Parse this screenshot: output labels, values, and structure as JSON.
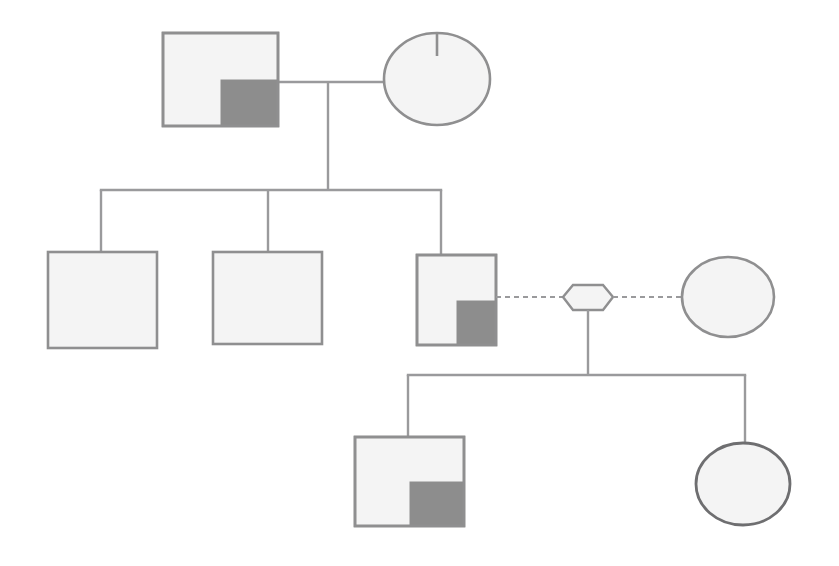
{
  "canvas": {
    "width": 839,
    "height": 566,
    "background": "#ffffff",
    "title": "Pedigree Chart"
  },
  "style": {
    "symbol_stroke": "#8f8f90",
    "symbol_stroke_dark": "#6e6e70",
    "symbol_fill_unaffected": "#f4f4f4",
    "symbol_fill_affected_quadrant": "#8d8d8d",
    "line_color": "#9a9a9c",
    "line_color_dark": "#8a8a8c",
    "stroke_width": 2.4,
    "dash_pattern": "5,4"
  },
  "legend": {
    "square_meaning": "male",
    "circle_meaning": "female",
    "hexagon_meaning": "pregnancy-or-adoption",
    "filled_quadrant_meaning": "affected",
    "solid_line_meaning": "biological-relationship",
    "dashed_line_meaning": "non-biological-relationship"
  },
  "generations": [
    {
      "id": "generation-1",
      "label": "I",
      "individuals": [
        {
          "id": "i-1",
          "shape": "square",
          "sex": "male",
          "affected": true,
          "affected_quadrant": "bottom-right",
          "marker": "none",
          "x": 163,
          "y": 33,
          "width": 115,
          "height": 93
        },
        {
          "id": "i-2",
          "shape": "ellipse",
          "sex": "female",
          "affected": false,
          "affected_quadrant": "none",
          "marker": "top-tick",
          "cx": 437,
          "cy": 79,
          "rx": 53,
          "ry": 46
        }
      ]
    },
    {
      "id": "generation-2",
      "label": "II",
      "individuals": [
        {
          "id": "ii-1",
          "shape": "square",
          "sex": "male",
          "affected": false,
          "affected_quadrant": "none",
          "marker": "none",
          "x": 48,
          "y": 252,
          "width": 109,
          "height": 96
        },
        {
          "id": "ii-2",
          "shape": "square",
          "sex": "male",
          "affected": false,
          "affected_quadrant": "none",
          "marker": "none",
          "x": 213,
          "y": 252,
          "width": 109,
          "height": 92
        },
        {
          "id": "ii-3",
          "shape": "square",
          "sex": "male",
          "affected": true,
          "affected_quadrant": "bottom-right",
          "marker": "none",
          "x": 417,
          "y": 255,
          "width": 79,
          "height": 90
        },
        {
          "id": "ii-4",
          "shape": "hexagon",
          "sex": "unknown",
          "affected": false,
          "affected_quadrant": "none",
          "marker": "none",
          "cx": 588,
          "cy": 297,
          "width": 50,
          "height": 26
        },
        {
          "id": "ii-5",
          "shape": "ellipse",
          "sex": "female",
          "affected": false,
          "affected_quadrant": "none",
          "marker": "none",
          "cx": 728,
          "cy": 297,
          "rx": 46,
          "ry": 40
        }
      ]
    },
    {
      "id": "generation-3",
      "label": "III",
      "individuals": [
        {
          "id": "iii-1",
          "shape": "square",
          "sex": "male",
          "affected": true,
          "affected_quadrant": "bottom-right",
          "marker": "none",
          "x": 355,
          "y": 437,
          "width": 109,
          "height": 89
        },
        {
          "id": "iii-2",
          "shape": "ellipse",
          "sex": "female",
          "affected": false,
          "affected_quadrant": "none",
          "marker": "none",
          "cx": 743,
          "cy": 484,
          "rx": 47,
          "ry": 41
        }
      ]
    }
  ],
  "connections": {
    "mating_line_1": {
      "type": "solid",
      "x1": 278,
      "y1": 82,
      "x2": 384,
      "y2": 82
    },
    "descent_line_1": {
      "type": "solid",
      "x1": 328,
      "y1": 82,
      "x2": 328,
      "y2": 190
    },
    "sibship_line_1": {
      "type": "solid",
      "x1": 101,
      "y1": 190,
      "x2": 441,
      "y2": 190
    },
    "sib_drop_1": {
      "type": "solid",
      "x1": 101,
      "y1": 190,
      "x2": 101,
      "y2": 252
    },
    "sib_drop_2": {
      "type": "solid",
      "x1": 268,
      "y1": 190,
      "x2": 268,
      "y2": 252
    },
    "sib_drop_3": {
      "type": "solid",
      "x1": 441,
      "y1": 190,
      "x2": 441,
      "y2": 255
    },
    "dashed_link_left": {
      "type": "dashed",
      "x1": 496,
      "y1": 297,
      "x2": 563,
      "y2": 297
    },
    "dashed_link_right": {
      "type": "dashed",
      "x1": 613,
      "y1": 297,
      "x2": 682,
      "y2": 297
    },
    "descent_line_2": {
      "type": "solid",
      "x1": 588,
      "y1": 310,
      "x2": 588,
      "y2": 375
    },
    "sibship_line_2": {
      "type": "solid",
      "x1": 408,
      "y1": 375,
      "x2": 745,
      "y2": 375
    },
    "sib_drop_4": {
      "type": "solid",
      "x1": 408,
      "y1": 375,
      "x2": 408,
      "y2": 437
    },
    "sib_drop_5": {
      "type": "solid",
      "x1": 745,
      "y1": 375,
      "x2": 745,
      "y2": 443
    }
  }
}
